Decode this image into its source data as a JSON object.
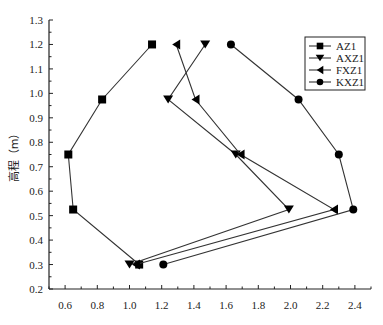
{
  "chart_data": {
    "type": "line",
    "title": "",
    "xlabel": "",
    "ylabel": "高程（m）",
    "xlim": [
      0.5,
      2.5
    ],
    "ylim": [
      0.2,
      1.3
    ],
    "x_ticks": [
      "0.6",
      "0.8",
      "1.0",
      "1.2",
      "1.4",
      "1.6",
      "1.8",
      "2.0",
      "2.2",
      "2.4"
    ],
    "y_ticks": [
      "0.2",
      "0.3",
      "0.4",
      "0.5",
      "0.6",
      "0.7",
      "0.8",
      "0.9",
      "1.0",
      "1.1",
      "1.2",
      "1.3"
    ],
    "grid": false,
    "legend_position": "upper right",
    "series": [
      {
        "name": "AZ1",
        "marker": "square",
        "points": [
          [
            1.14,
            1.2
          ],
          [
            0.83,
            0.975
          ],
          [
            0.62,
            0.75
          ],
          [
            0.65,
            0.525
          ],
          [
            1.06,
            0.3
          ]
        ]
      },
      {
        "name": "AXZ1",
        "marker": "triangle-down",
        "points": [
          [
            1.47,
            1.2
          ],
          [
            1.24,
            0.975
          ],
          [
            1.66,
            0.75
          ],
          [
            1.99,
            0.525
          ],
          [
            1.0,
            0.3
          ]
        ]
      },
      {
        "name": "FXZ1",
        "marker": "triangle-left",
        "points": [
          [
            1.29,
            1.2
          ],
          [
            1.41,
            0.975
          ],
          [
            1.69,
            0.75
          ],
          [
            2.27,
            0.525
          ],
          [
            1.04,
            0.3
          ]
        ]
      },
      {
        "name": "KXZ1",
        "marker": "circle",
        "points": [
          [
            1.63,
            1.2
          ],
          [
            2.05,
            0.975
          ],
          [
            2.3,
            0.75
          ],
          [
            2.39,
            0.525
          ],
          [
            1.21,
            0.3
          ]
        ]
      }
    ]
  },
  "colors": {
    "line": "#333333",
    "marker": "#000000",
    "axis": "#222222"
  }
}
